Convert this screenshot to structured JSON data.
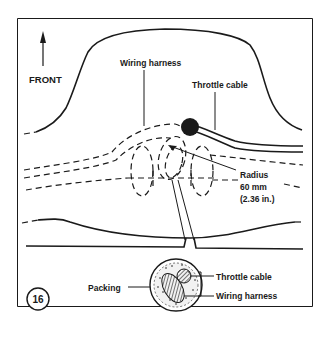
{
  "figure": {
    "number": "16",
    "orientation_label": "FRONT",
    "labels": {
      "wiring_harness_top": "Wiring harness",
      "throttle_cable_top": "Throttle cable",
      "radius_line1": "Radius",
      "radius_line2": "60 mm",
      "radius_line3": "(2.36 in.)",
      "packing": "Packing",
      "throttle_cable_detail": "Throttle cable",
      "wiring_harness_detail": "Wiring harness"
    },
    "icons": [
      "front-arrow-icon"
    ],
    "colors": {
      "ink": "#1a1a1a",
      "background": "#ffffff"
    }
  }
}
